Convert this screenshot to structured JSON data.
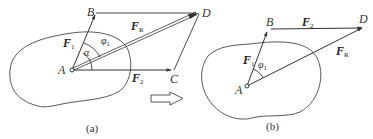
{
  "figure": {
    "stroke_color": "#333333",
    "background": "#ffffff"
  },
  "panel_a": {
    "caption": "(a)",
    "points": {
      "A": "A",
      "B": "B",
      "C": "C",
      "D": "D"
    },
    "forces": {
      "F1": {
        "base": "F",
        "sub": "1"
      },
      "F2": {
        "base": "F",
        "sub": "2"
      },
      "FR": {
        "base": "F",
        "sub": "R"
      }
    },
    "angles": {
      "alpha": "α",
      "phi": "φ",
      "phi_sub": "1"
    }
  },
  "panel_b": {
    "caption": "(b)",
    "points": {
      "A": "A",
      "B": "B",
      "D": "D"
    },
    "forces": {
      "F1": {
        "base": "F",
        "sub": "1"
      },
      "F2": {
        "base": "F",
        "sub": "2"
      },
      "FR": {
        "base": "F",
        "sub": "R"
      }
    },
    "angles": {
      "phi": "φ",
      "phi_sub": "1"
    }
  },
  "transition_arrow": {
    "icon": "hollow-right-arrow-icon"
  }
}
